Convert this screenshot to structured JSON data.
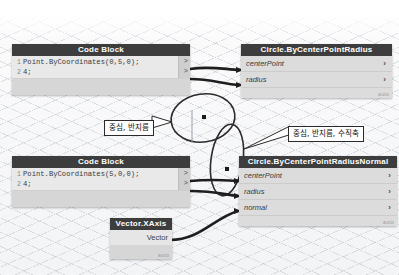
{
  "canvas": {
    "background_color": "#f4f5f7",
    "grid_color": "#969ba5"
  },
  "nodes": [
    {
      "id": "code-block-1",
      "type": "code-block",
      "title": "Code Block",
      "lines": [
        {
          "num": "1",
          "code": "Point.ByCoordinates(0,5,0);"
        },
        {
          "num": "2",
          "code": "4;"
        }
      ],
      "out_ports": [
        ">",
        ">"
      ]
    },
    {
      "id": "code-block-2",
      "type": "code-block",
      "title": "Code Block",
      "lines": [
        {
          "num": "1",
          "code": "Point.ByCoordinates(5,0,0);"
        },
        {
          "num": "2",
          "code": "4;"
        }
      ],
      "out_ports": [
        ">",
        ">"
      ]
    },
    {
      "id": "circle-by-center-point-radius",
      "type": "function",
      "title": "Circle.ByCenterPointRadius",
      "inputs": [
        "centerPoint",
        "radius"
      ],
      "chevron": "›",
      "output": "Circle",
      "badge": "auto"
    },
    {
      "id": "circle-by-center-point-radius-normal",
      "type": "function",
      "title": "Circle.ByCenterPointRadiusNormal",
      "inputs": [
        "centerPoint",
        "radius",
        "normal"
      ],
      "chevron": "›",
      "output": "Circle",
      "badge": "auto"
    },
    {
      "id": "vector-xaxis",
      "type": "function",
      "title": "Vector.XAxis",
      "inputs": [],
      "output": "Vector",
      "badge": "auto"
    }
  ],
  "badges": {
    "auto": "auto"
  },
  "annotations": [
    {
      "id": "callout-center-radius",
      "text": "중심, 반지름"
    },
    {
      "id": "callout-center-radius-normal",
      "text": "중심, 반지름, 수직축"
    }
  ],
  "geometry": {
    "circles": [
      {
        "id": "circle-upper",
        "label": "circle-geometry-upper"
      },
      {
        "id": "circle-lower",
        "label": "circle-geometry-lower"
      }
    ],
    "points": [
      {
        "id": "center-point-upper"
      },
      {
        "id": "center-point-lower"
      }
    ]
  }
}
